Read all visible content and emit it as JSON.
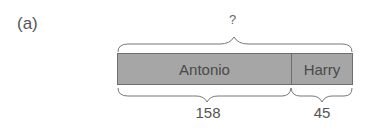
{
  "figure": {
    "panel_label": "(a)",
    "total_label": "?",
    "segments": [
      {
        "name": "Antonio",
        "value": "158"
      },
      {
        "name": "Harry",
        "value": "45"
      }
    ],
    "colors": {
      "bar_fill": "#a6a6a6",
      "bar_border": "#6e6e6e",
      "text": "#555555"
    }
  }
}
